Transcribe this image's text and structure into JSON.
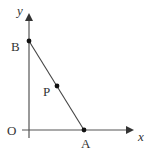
{
  "diagram": {
    "type": "coordinate-geometry",
    "axes": {
      "x_label": "x",
      "y_label": "y",
      "origin_label": "O"
    },
    "points": [
      {
        "name": "A",
        "label": "A",
        "description": "x-intercept of line"
      },
      {
        "name": "B",
        "label": "B",
        "description": "y-intercept of line"
      },
      {
        "name": "P",
        "label": "P",
        "description": "point on segment AB"
      }
    ],
    "segments": [
      {
        "from": "B",
        "to": "A"
      }
    ],
    "colors": {
      "axis": "#333333",
      "line": "#333333",
      "point": "#111111",
      "background": "#ffffff"
    }
  }
}
